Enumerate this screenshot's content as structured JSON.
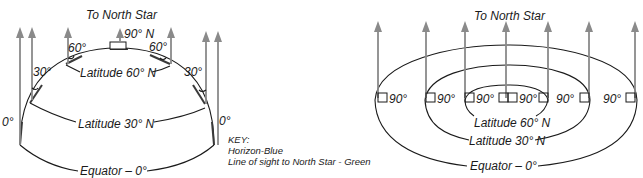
{
  "left_diagram": {
    "title": "To North Star",
    "pole_label": "90° N",
    "angles": {
      "left_60": "60°",
      "right_60": "60°",
      "left_30": "30°",
      "right_30": "30°",
      "left_0": "0°",
      "right_0": "0°"
    },
    "latitude_60": "Latitude 60° N",
    "latitude_30": "Latitude 30° N",
    "equator": "Equator – 0°"
  },
  "key": {
    "title": "KEY:",
    "horizon": "Horizon-Blue",
    "line_of_sight": "Line of sight to North Star - Green"
  },
  "right_diagram": {
    "title": "To North Star",
    "angle_labels": [
      "90°",
      "90°",
      "90°",
      "90°",
      "90°",
      "90°"
    ],
    "latitude_60": "Latitude 60° N",
    "latitude_30": "Latitude 30° N",
    "equator": "Equator – 0°"
  },
  "colors": {
    "arrow": "#8a8a8a",
    "line": "#1a1a1a"
  }
}
